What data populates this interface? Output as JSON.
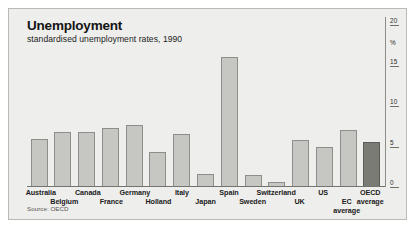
{
  "chart_data": {
    "type": "bar",
    "title": "Unemployment",
    "subtitle": "standardised unemployment rates, 1990",
    "source": "Source: OECD",
    "xlabel": "",
    "ylabel": "%",
    "ylim": [
      0,
      20
    ],
    "yticks": [
      0,
      5,
      10,
      15,
      20
    ],
    "ytick_labels": [
      "0",
      "5",
      "10",
      "15",
      "20"
    ],
    "grid": false,
    "legend": "none",
    "axis_position": "right",
    "categories": [
      "Australia",
      "Belgium",
      "Canada",
      "France",
      "Germany",
      "Holland",
      "Italy",
      "Japan",
      "Spain",
      "Sweden",
      "Switzerland",
      "UK",
      "US",
      "EC average",
      "OECD average"
    ],
    "values": [
      5.9,
      6.8,
      6.8,
      7.3,
      7.6,
      4.3,
      6.5,
      1.6,
      16.0,
      1.5,
      0.6,
      5.8,
      5.0,
      7.1,
      5.6
    ],
    "bars": [
      {
        "label": "Australia",
        "value": 5.9,
        "highlight": false,
        "label_row": 0
      },
      {
        "label": "Belgium",
        "value": 6.8,
        "highlight": false,
        "label_row": 1
      },
      {
        "label": "Canada",
        "value": 6.8,
        "highlight": false,
        "label_row": 0
      },
      {
        "label": "France",
        "value": 7.3,
        "highlight": false,
        "label_row": 1
      },
      {
        "label": "Germany",
        "value": 7.6,
        "highlight": false,
        "label_row": 0
      },
      {
        "label": "Holland",
        "value": 4.3,
        "highlight": false,
        "label_row": 1
      },
      {
        "label": "Italy",
        "value": 6.5,
        "highlight": false,
        "label_row": 0
      },
      {
        "label": "Japan",
        "value": 1.6,
        "highlight": false,
        "label_row": 1
      },
      {
        "label": "Spain",
        "value": 16.0,
        "highlight": false,
        "label_row": 0
      },
      {
        "label": "Sweden",
        "value": 1.5,
        "highlight": false,
        "label_row": 1
      },
      {
        "label": "Switzerland",
        "value": 0.6,
        "highlight": false,
        "label_row": 0
      },
      {
        "label": "UK",
        "value": 5.8,
        "highlight": false,
        "label_row": 1
      },
      {
        "label": "US",
        "value": 5.0,
        "highlight": false,
        "label_row": 0
      },
      {
        "label": "EC average",
        "value": 7.1,
        "highlight": false,
        "label_row": 1
      },
      {
        "label": "OECD average",
        "value": 5.6,
        "highlight": true,
        "label_row": 0
      }
    ],
    "colors": {
      "bar_fill": "#c6c6c2",
      "bar_stroke": "#8e8e89",
      "highlight_fill": "#7b7b76",
      "highlight_stroke": "#5b5b57",
      "panel_background": "#eeeeec",
      "page_background": "#ffffff",
      "axis": "#74746f",
      "text": "#141414"
    }
  }
}
